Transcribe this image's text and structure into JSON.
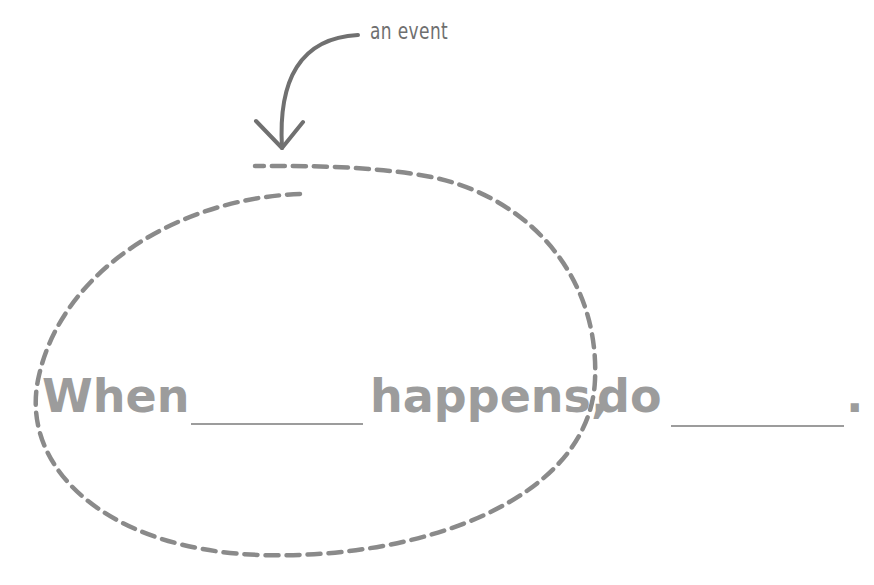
{
  "diagram": {
    "annotation": {
      "label": "an event",
      "color": "#6f6f6f"
    },
    "sentence": {
      "words": [
        "When",
        "happens,",
        "do",
        "."
      ],
      "blank_count": 2,
      "text_color": "#9c9c9c"
    },
    "highlight_shape": {
      "type": "dashed-ellipse",
      "color": "#8a8a8a"
    },
    "arrow": {
      "from": "annotation",
      "to": "highlight_shape",
      "color": "#707070"
    }
  }
}
